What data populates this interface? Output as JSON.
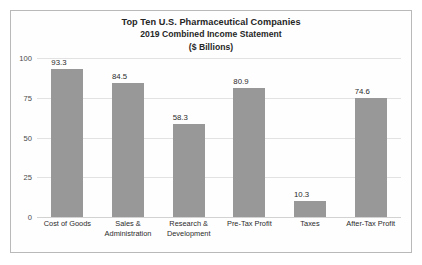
{
  "chart_data": {
    "type": "bar",
    "title": "Top Ten U.S. Pharmaceutical Companies",
    "subtitle": "2019 Combined Income Statement",
    "units": "($ Billions)",
    "xlabel": "",
    "ylabel": "",
    "ylim": [
      0,
      100
    ],
    "yticks": [
      100,
      75,
      50,
      25,
      0
    ],
    "grid": true,
    "legend": false,
    "bar_color": "#989898",
    "categories": [
      "Cost of Goods",
      "Sales & Administration",
      "Research & Development",
      "Pre-Tax Profit",
      "Taxes",
      "After-Tax Profit"
    ],
    "category_lines": [
      [
        "Cost of Goods"
      ],
      [
        "Sales &",
        "Administration"
      ],
      [
        "Research &",
        "Development"
      ],
      [
        "Pre-Tax Profit"
      ],
      [
        "Taxes"
      ],
      [
        "After-Tax Profit"
      ]
    ],
    "values": [
      93.3,
      84.5,
      58.3,
      80.9,
      10.3,
      74.6
    ],
    "value_labels": [
      "93.3",
      "84.5",
      "58.3",
      "80.9",
      "10.3",
      "74.6"
    ]
  }
}
